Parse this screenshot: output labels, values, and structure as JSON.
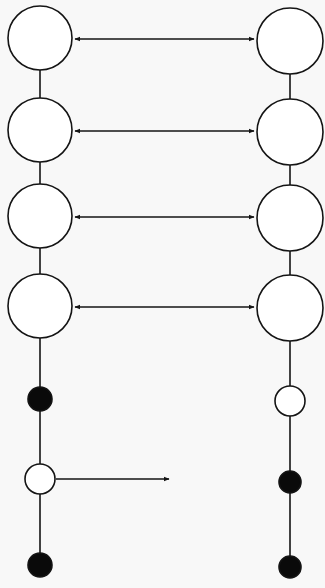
{
  "diagram": {
    "title": "",
    "canvas": {
      "width": 325,
      "height": 588,
      "background": "#f8f8f8"
    },
    "style": {
      "stroke": "#141414",
      "fill_open": "#ffffff",
      "fill_solid": "#0a0a0a",
      "stroke_width": 1.6
    },
    "left_chain": {
      "x": 40,
      "spine": {
        "y1": 38,
        "y2": 565
      },
      "nodes": [
        {
          "id": "L1",
          "type": "large-open",
          "cy": 38,
          "r": 32
        },
        {
          "id": "L2",
          "type": "large-open",
          "cy": 130,
          "r": 32
        },
        {
          "id": "L3",
          "type": "large-open",
          "cy": 216,
          "r": 32
        },
        {
          "id": "L4",
          "type": "large-open",
          "cy": 306,
          "r": 32
        },
        {
          "id": "L5",
          "type": "small-filled",
          "cy": 399,
          "r": 12
        },
        {
          "id": "L6",
          "type": "small-open",
          "cy": 479,
          "r": 15
        },
        {
          "id": "L7",
          "type": "small-filled",
          "cy": 565,
          "r": 12
        }
      ]
    },
    "right_chain": {
      "x": 290,
      "spine": {
        "y1": 41,
        "y2": 567
      },
      "nodes": [
        {
          "id": "R1",
          "type": "large-open",
          "cy": 41,
          "r": 33
        },
        {
          "id": "R2",
          "type": "large-open",
          "cy": 132,
          "r": 33
        },
        {
          "id": "R3",
          "type": "large-open",
          "cy": 218,
          "r": 33
        },
        {
          "id": "R4",
          "type": "large-open",
          "cy": 308,
          "r": 33
        },
        {
          "id": "R5",
          "type": "small-open",
          "cy": 401,
          "r": 15
        },
        {
          "id": "R6",
          "type": "small-filled",
          "cy": 482,
          "r": 11
        },
        {
          "id": "R7",
          "type": "small-filled",
          "cy": 567,
          "r": 11
        }
      ]
    },
    "connectors": [
      {
        "id": "A1",
        "from": "L1",
        "to": "R1",
        "x1": 75,
        "x2": 254,
        "y": 39,
        "direction": "bidirectional"
      },
      {
        "id": "A2",
        "from": "L2",
        "to": "R2",
        "x1": 75,
        "x2": 254,
        "y": 131,
        "direction": "bidirectional"
      },
      {
        "id": "A3",
        "from": "L3",
        "to": "R3",
        "x1": 75,
        "x2": 254,
        "y": 217,
        "direction": "bidirectional"
      },
      {
        "id": "A4",
        "from": "L4",
        "to": "R4",
        "x1": 75,
        "x2": 254,
        "y": 307,
        "direction": "bidirectional"
      },
      {
        "id": "A5",
        "from": "L6",
        "to": null,
        "x1": 56,
        "x2": 169,
        "y": 479,
        "direction": "forward"
      }
    ]
  }
}
